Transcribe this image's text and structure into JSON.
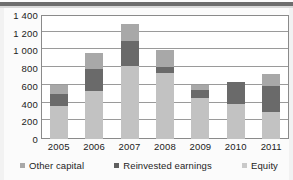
{
  "figure": {
    "background": "#ffffff",
    "frame_color": "#8a8a8a"
  },
  "legend": {
    "position": "bottom",
    "items": [
      {
        "label": "Other capital",
        "color": "#a8a8a8",
        "swatch": "other"
      },
      {
        "label": "Reinvested earnings",
        "color": "#5f5f5f",
        "swatch": "reinv"
      },
      {
        "label": "Equity",
        "color": "#c9c9c9",
        "swatch": "equity"
      }
    ]
  },
  "chart_data": {
    "type": "bar",
    "stacked": true,
    "title": "",
    "subtitle": "",
    "xlabel": "",
    "ylabel": "",
    "grid": true,
    "ylim": [
      0,
      1400
    ],
    "yticks": [
      0,
      200,
      400,
      600,
      800,
      1000,
      1200,
      1400
    ],
    "ytick_labels": [
      "0",
      "200",
      "400",
      "600",
      "800",
      "1 000",
      "1 200",
      "1 400"
    ],
    "categories": [
      "2005",
      "2006",
      "2007",
      "2008",
      "2009",
      "2010",
      "2011"
    ],
    "series": [
      {
        "name": "Equity",
        "color": "#c2c2c2",
        "values": [
          375,
          540,
          820,
          745,
          465,
          390,
          310
        ]
      },
      {
        "name": "Reinvested earnings",
        "color": "#6a6a6a",
        "values": [
          130,
          250,
          290,
          65,
          85,
          250,
          285
        ]
      },
      {
        "name": "Other capital",
        "color": "#a8a8a8",
        "values": [
          110,
          180,
          190,
          200,
          65,
          5,
          140
        ]
      }
    ],
    "totals": [
      615,
      970,
      1300,
      1010,
      615,
      645,
      735
    ]
  }
}
